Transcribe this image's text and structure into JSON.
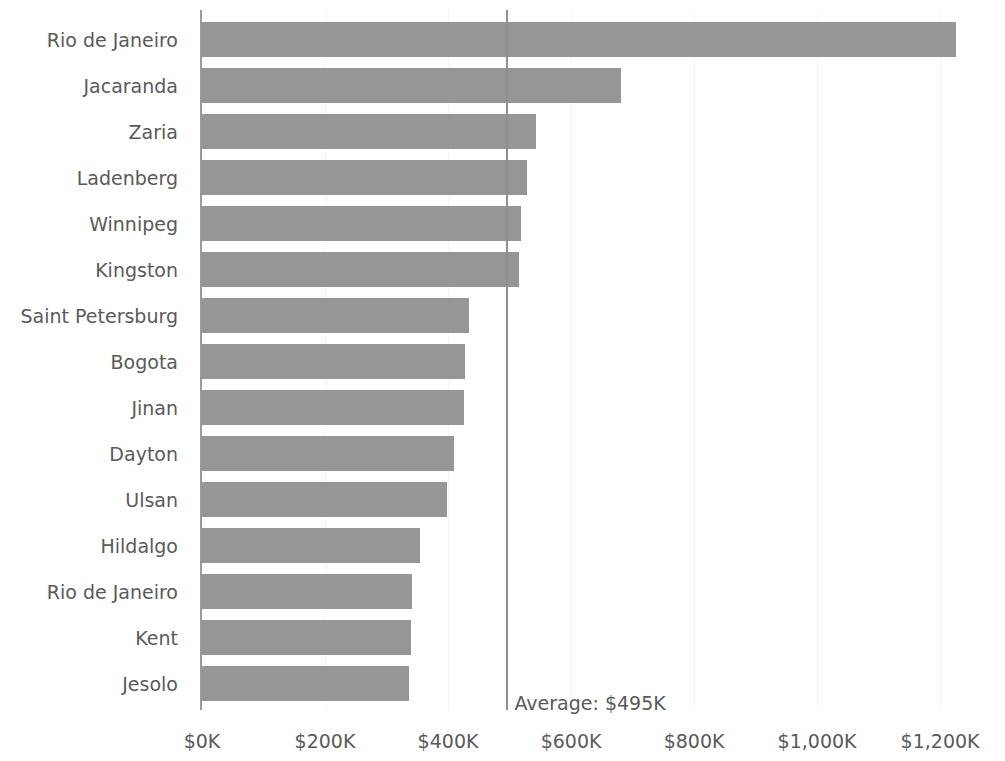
{
  "chart_data": {
    "type": "bar",
    "orientation": "horizontal",
    "title": "",
    "xlabel": "",
    "ylabel": "",
    "categories": [
      "Rio de Janeiro",
      "Jacaranda",
      "Zaria",
      "Ladenberg",
      "Winnipeg",
      "Kingston",
      "Saint Petersburg",
      "Bogota",
      "Jinan",
      "Dayton",
      "Ulsan",
      "Hildalgo",
      "Rio de Janeiro",
      "Kent",
      "Jesolo"
    ],
    "values": [
      1226,
      682,
      543,
      529,
      519,
      516,
      434,
      428,
      426,
      410,
      399,
      355,
      342,
      339,
      337
    ],
    "value_unit": "K",
    "value_prefix": "$",
    "xlim": [
      0,
      1260
    ],
    "x_ticks": [
      0,
      200,
      400,
      600,
      800,
      1000,
      1200
    ],
    "x_tick_labels": [
      "$0K",
      "$200K",
      "$400K",
      "$600K",
      "$800K",
      "$1,000K",
      "$1,200K"
    ],
    "grid": "faint-vertical",
    "legend": "none",
    "reference_line": {
      "name": "average",
      "value": 495,
      "label": "Average: $495K"
    },
    "colors": {
      "bar_fill": "#969696",
      "axis_line": "#9b9b9b",
      "reference_line": "#8f8f8f",
      "text": "#5a5a5a",
      "background": "#ffffff",
      "gridline": "#f4f4f4"
    }
  },
  "axis": {
    "y_axis_name": "city",
    "x_axis_name": "value"
  }
}
